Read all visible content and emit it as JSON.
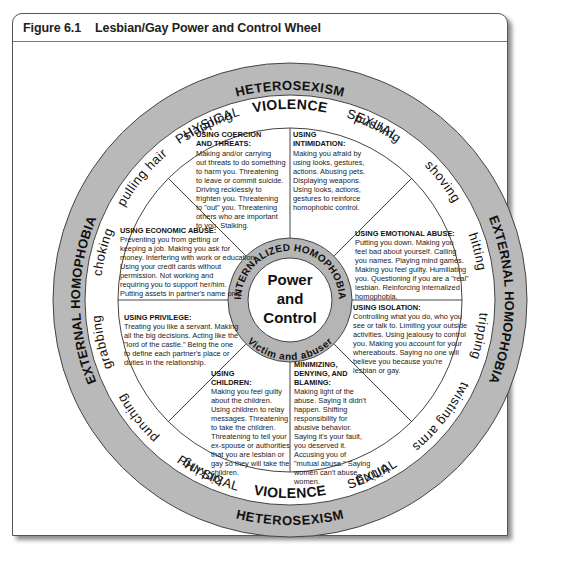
{
  "figure": {
    "number": "Figure 6.1",
    "title": "Lesbian/Gay Power and Control Wheel"
  },
  "colors": {
    "ring_gray": "#b9b9b9",
    "inner_ring_gray": "#b5b5b5",
    "line": "#333333",
    "text": "#111111"
  },
  "wheel": {
    "outer_ring": {
      "top": "HETEROSEXISM",
      "bottom": "HETEROSEXISM",
      "left": "EXTERNAL HOMOPHOBIA",
      "right": "EXTERNAL HOMOPHOBIA"
    },
    "violence_ring": {
      "top_left": "PHYSICAL",
      "top_center": "VIOLENCE",
      "top_right": "SEXUAL",
      "bottom_left": "PHYSICAL",
      "bottom_center": "VIOLENCE",
      "bottom_right": "SEXUAL",
      "acts_left": [
        "slapping",
        "pulling hair",
        "choking",
        "grabbing",
        "punching",
        "kicking"
      ],
      "acts_right": [
        "pushing",
        "shoving",
        "hitting",
        "tripping",
        "twisting arms",
        "biting"
      ]
    },
    "center": {
      "line1": "Power",
      "line2": "and",
      "line3": "Control",
      "ring_top": "INTERNALIZED HOMOPHOBIA",
      "ring_bottom": "Victim and abuser"
    },
    "sections": [
      {
        "id": "coercion",
        "title": [
          "USING COERCION",
          "AND THREATS:"
        ],
        "body": [
          "Making and/or carrying",
          "out threats to do something",
          "to harm you. Threatening",
          "to leave or commit suicide.",
          "Driving recklessly to",
          "frighten you. Threatening",
          "to \"out\" you. Threatening",
          "others who are important",
          "to you. Stalking."
        ]
      },
      {
        "id": "intimidation",
        "title": [
          "USING",
          "INTIMIDATION:"
        ],
        "body": [
          "Making you afraid by",
          "using looks, gestures,",
          "actions. Abusing pets.",
          "Displaying weapons.",
          "Using looks, actions,",
          "gestures to reinforce",
          "homophobic control."
        ]
      },
      {
        "id": "emotional",
        "title": [
          "USING EMOTIONAL ABUSE:"
        ],
        "body": [
          "Putting you down. Making you",
          "feel bad about yourself. Calling",
          "you names. Playing mind games.",
          "Making you feel guilty. Humiliating",
          "you. Questioning if you are a \"real\"",
          "lesbian. Reinforcing internalized",
          "homophobia."
        ]
      },
      {
        "id": "isolation",
        "title": [
          "USING ISOLATION:"
        ],
        "body": [
          "Controlling what you do, who you",
          "see or talk to. Limiting your outside",
          "activities. Using jealousy to control",
          "you. Making you account for your",
          "whereabouts. Saying no one will",
          "believe you because you're",
          "lesbian or gay."
        ]
      },
      {
        "id": "minimizing",
        "title": [
          "MINIMIZING,",
          "DENYING, AND",
          "BLAMING:"
        ],
        "body": [
          "Making light of the",
          "abuse. Saying it didn't",
          "happen. Shifting",
          "responsibility for",
          "abusive behavior.",
          "Saying it's your fault,",
          "you deserved it.",
          "Accusing you of",
          "\"mutual abuse.\" Saying",
          "women can't abuse",
          "women."
        ]
      },
      {
        "id": "children",
        "title": [
          "USING",
          "CHILDREN:"
        ],
        "body": [
          "Making you feel guilty",
          "about the children.",
          "Using children to relay",
          "messages. Threatening",
          "to take the children.",
          "Threatening to tell your",
          "ex-spouse or authorities",
          "that you are lesbian or",
          "gay so they will take the",
          "children."
        ]
      },
      {
        "id": "privilege",
        "title": [
          "USING PRIVILEGE:"
        ],
        "body": [
          "Treating you like a servant. Making",
          "all the big decisions. Acting like the",
          "\"lord of the castle.\" Being the one",
          "to define each partner's place or",
          "duties in the relationship."
        ]
      },
      {
        "id": "economic",
        "title": [
          "USING ECONOMIC ABUSE:"
        ],
        "body": [
          "Preventing you from getting or",
          "keeping a job. Making you ask for",
          "money. Interfering with work or education.",
          "Using your credit cards without",
          "permission. Not working and",
          "requiring you to support her/him.",
          "Putting assets in partner's name only."
        ]
      }
    ]
  }
}
